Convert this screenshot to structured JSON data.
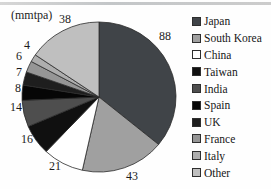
{
  "page": {
    "background": "#fefefe",
    "top_rule_color": "#c9c9c9"
  },
  "chart_data": {
    "type": "pie",
    "unit_label": "(mmtpa)",
    "categories": [
      "Japan",
      "South Korea",
      "China",
      "Taiwan",
      "India",
      "Spain",
      "UK",
      "France",
      "Italy",
      "Other"
    ],
    "values": [
      88,
      43,
      21,
      16,
      14,
      8,
      7,
      6,
      4,
      38
    ],
    "total": 245,
    "colors": [
      "#404448",
      "#a0a0a0",
      "#ffffff",
      "#101010",
      "#4e4e4e",
      "#060606",
      "#1e1e1e",
      "#969696",
      "#aeaeae",
      "#bfbfbf"
    ],
    "slice_outline_color": "#2b2b2b",
    "start_angle_deg": 0,
    "direction": "clockwise",
    "legend_position": "right",
    "data_labels": "values-outside"
  }
}
